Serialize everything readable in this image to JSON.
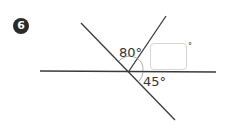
{
  "question": {
    "number": "6",
    "angles": [
      {
        "label": "80°"
      },
      {
        "label": "45°"
      }
    ],
    "answer": {
      "value": "",
      "unit": "°"
    }
  },
  "colors": {
    "badge": "#2b2b2b",
    "lines": "#3a3a3a",
    "arc": "#9a9a9a",
    "answer_border": "#d6d6d6"
  }
}
